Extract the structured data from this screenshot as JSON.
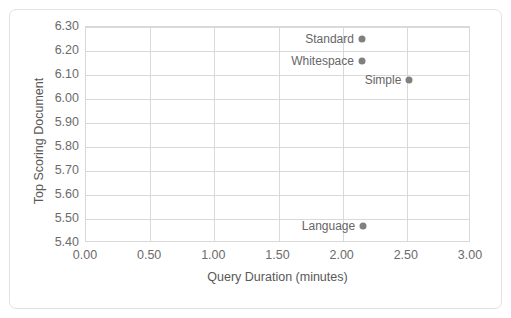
{
  "chart_data": {
    "type": "scatter",
    "title": "",
    "xlabel": "Query Duration (minutes)",
    "ylabel": "Top Scoring Document",
    "xlim": [
      0.0,
      3.0
    ],
    "ylim": [
      5.4,
      6.3
    ],
    "xticks": [
      "0.00",
      "0.50",
      "1.00",
      "1.50",
      "2.00",
      "2.50",
      "3.00"
    ],
    "xtick_values": [
      0.0,
      0.5,
      1.0,
      1.5,
      2.0,
      2.5,
      3.0
    ],
    "yticks": [
      "5.40",
      "5.50",
      "5.60",
      "5.70",
      "5.80",
      "5.90",
      "6.00",
      "6.10",
      "6.20",
      "6.30"
    ],
    "ytick_values": [
      5.4,
      5.5,
      5.6,
      5.7,
      5.8,
      5.9,
      6.0,
      6.1,
      6.2,
      6.3
    ],
    "grid": true,
    "legend": "none",
    "marker_color": "#808080",
    "points": [
      {
        "label": "Standard",
        "x": 2.15,
        "y": 6.25
      },
      {
        "label": "Whitespace",
        "x": 2.15,
        "y": 6.16
      },
      {
        "label": "Simple",
        "x": 2.52,
        "y": 6.08
      },
      {
        "label": "Language",
        "x": 2.16,
        "y": 5.47
      }
    ]
  }
}
